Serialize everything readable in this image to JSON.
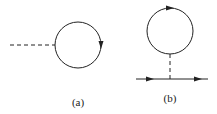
{
  "diagrams": [
    {
      "label": "(a)",
      "description": "tadpole diagram: dashed external line attached to a closed loop with arrow",
      "circle": {
        "cx": 78,
        "cy": 45,
        "r": 23
      },
      "dashed_line": {
        "x1": 10,
        "y1": 45,
        "x2": 55,
        "y2": 45
      },
      "arrow": {
        "x": 101,
        "y": 45,
        "direction": "down"
      },
      "label_pos": {
        "x": 78,
        "y": 96
      }
    },
    {
      "label": "(b)",
      "description": "tadpole diagram: closed loop connected by dashed line to a solid fermion line",
      "circle": {
        "cx": 170,
        "cy": 31,
        "r": 23
      },
      "dashed_line": {
        "x1": 170,
        "y1": 54,
        "x2": 170,
        "y2": 79
      },
      "solid_line": {
        "x1": 136,
        "y1": 79,
        "x2": 208,
        "y2": 79
      },
      "arrows": [
        {
          "x": 170,
          "y": 8,
          "direction": "right"
        },
        {
          "x": 150,
          "y": 79,
          "direction": "right"
        },
        {
          "x": 198,
          "y": 79,
          "direction": "right"
        }
      ],
      "label_pos": {
        "x": 170,
        "y": 92
      }
    }
  ],
  "colors": {
    "stroke": "#222222",
    "background": "#ffffff"
  }
}
